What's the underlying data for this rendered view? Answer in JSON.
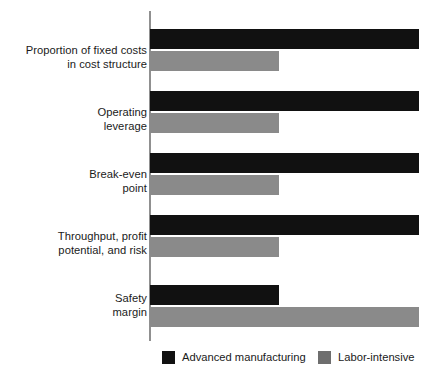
{
  "chart_data": {
    "type": "bar",
    "orientation": "horizontal",
    "title": "",
    "subtitle": "",
    "xlabel": "",
    "ylabel": "",
    "grid": false,
    "axis": {
      "x_ticks": [],
      "y_ticks": [],
      "xlim": [
        0,
        100
      ]
    },
    "legend": {
      "position": "bottom-center",
      "entries": [
        {
          "name": "Advanced manufacturing",
          "color": "#111111"
        },
        {
          "name": "Labor-intensive",
          "color": "#6e6e6e"
        }
      ]
    },
    "categories": [
      "Proportion of fixed costs in cost structure",
      "Operating leverage",
      "Break-even point",
      "Throughput, profit potential, and risk",
      "Safety margin"
    ],
    "category_lines": [
      [
        "Proportion of fixed costs",
        "in cost structure"
      ],
      [
        "Operating",
        "leverage"
      ],
      [
        "Break-even",
        "point"
      ],
      [
        "Throughput, profit",
        "potential, and risk"
      ],
      [
        "Safety",
        "margin"
      ]
    ],
    "series": [
      {
        "name": "Advanced manufacturing",
        "color": "#111111",
        "values": [
          100,
          100,
          100,
          100,
          48
        ]
      },
      {
        "name": "Labor-intensive",
        "color": "#8a8a8a",
        "values": [
          48,
          48,
          48,
          48,
          100
        ]
      }
    ]
  },
  "legend": {
    "advanced_label": "Advanced manufacturing",
    "labor_label": "Labor-intensive"
  },
  "labels": {
    "row0_line1": "Proportion of fixed costs",
    "row0_line2": "in cost structure",
    "row1_line1": "Operating",
    "row1_line2": "leverage",
    "row2_line1": "Break-even",
    "row2_line2": "point",
    "row3_line1": "Throughput, profit",
    "row3_line2": "potential, and risk",
    "row4_line1": "Safety",
    "row4_line2": "margin"
  }
}
